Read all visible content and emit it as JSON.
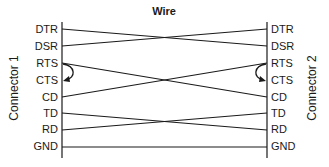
{
  "title": "Wire",
  "left_connector": "Connector 1",
  "right_connector": "Connector 2",
  "pins": [
    "DTR",
    "DSR",
    "RTS",
    "CTS",
    "CD",
    "TD",
    "RD",
    "GND"
  ],
  "wires": [
    {
      "from": "DTR",
      "to": "DSR"
    },
    {
      "from": "DSR",
      "to": "DTR"
    },
    {
      "from": "RTS",
      "to": "CD"
    },
    {
      "from": "CD",
      "to": "RTS"
    },
    {
      "from": "TD",
      "to": "RD"
    },
    {
      "from": "RD",
      "to": "TD"
    },
    {
      "from": "GND",
      "to": "GND"
    }
  ],
  "loopbacks": [
    {
      "side": "left",
      "from": "RTS",
      "to": "CTS"
    },
    {
      "side": "right",
      "from": "RTS",
      "to": "CTS"
    }
  ],
  "colors": {
    "line": "#1a1a1a",
    "background": "#ffffff"
  }
}
